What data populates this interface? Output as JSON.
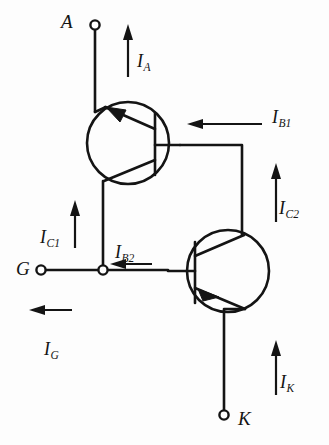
{
  "figure": {
    "type": "circuit-schematic",
    "background_color": "#fdfdfd",
    "line_color": "#141414"
  },
  "terminals": [
    {
      "id": "anode",
      "label": "A",
      "x": 95,
      "y": 22,
      "name": "anode-terminal"
    },
    {
      "id": "gate",
      "label": "G",
      "x": 38,
      "y": 270,
      "name": "gate-terminal"
    },
    {
      "id": "cathode",
      "label": "K",
      "x": 224,
      "y": 418,
      "name": "cathode-terminal"
    }
  ],
  "transistors": [
    {
      "id": "Q1",
      "type": "PNP",
      "center_x": 128,
      "center_y": 143,
      "radius": 41,
      "emitter": "anode",
      "base": "node-right",
      "collector": "gate-node"
    },
    {
      "id": "Q2",
      "type": "NPN",
      "center_x": 228,
      "center_y": 271,
      "radius": 41,
      "emitter": "cathode",
      "base": "gate-node",
      "collector": "node-right"
    }
  ],
  "currents": [
    {
      "id": "IA",
      "base": "I",
      "sub": "A",
      "direction": "up",
      "label_x": 137,
      "label_y": 52,
      "name": "current-label-ia"
    },
    {
      "id": "IB1",
      "base": "I",
      "sub": "B1",
      "direction": "left",
      "label_x": 272,
      "label_y": 108,
      "name": "current-label-ib1"
    },
    {
      "id": "IC2",
      "base": "I",
      "sub": "C2",
      "direction": "up",
      "label_x": 279,
      "label_y": 199,
      "name": "current-label-ic2"
    },
    {
      "id": "IC1",
      "base": "I",
      "sub": "C1",
      "direction": "up",
      "label_x": 40,
      "label_y": 228,
      "name": "current-label-ic1"
    },
    {
      "id": "IB2",
      "base": "I",
      "sub": "B2",
      "direction": "left",
      "label_x": 115,
      "label_y": 243,
      "name": "current-label-ib2"
    },
    {
      "id": "IG",
      "base": "I",
      "sub": "G",
      "direction": "left",
      "label_x": 44,
      "label_y": 340,
      "name": "current-label-ig"
    },
    {
      "id": "IK",
      "base": "I",
      "sub": "K",
      "direction": "up",
      "label_x": 280,
      "label_y": 373,
      "name": "current-label-ik"
    }
  ]
}
